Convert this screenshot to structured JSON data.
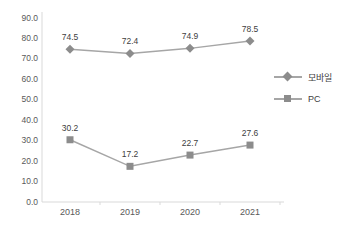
{
  "chart_data": {
    "type": "line",
    "title": "",
    "xlabel": "",
    "ylabel": "",
    "categories": [
      "2018",
      "2019",
      "2020",
      "2021"
    ],
    "series": [
      {
        "name": "모바일",
        "marker": "diamond",
        "values": [
          74.5,
          72.4,
          74.9,
          78.5
        ]
      },
      {
        "name": "PC",
        "marker": "square",
        "values": [
          30.2,
          17.2,
          22.7,
          27.6
        ]
      }
    ],
    "ylim": [
      0,
      90
    ],
    "ytick_step": 10,
    "ytick_labels": [
      "0.0",
      "10.0",
      "20.0",
      "30.0",
      "40.0",
      "50.0",
      "60.0",
      "70.0",
      "80.0",
      "90.0"
    ],
    "grid": false,
    "legend_position": "right",
    "data_labels": true
  },
  "colors": {
    "background": "#ffffff",
    "axis_line": "#d9d9d9",
    "series_line": "#a6a6a6",
    "series_marker": "#8c8c8c",
    "data_label_text": "#404040",
    "tick_label_text": "#595959"
  }
}
